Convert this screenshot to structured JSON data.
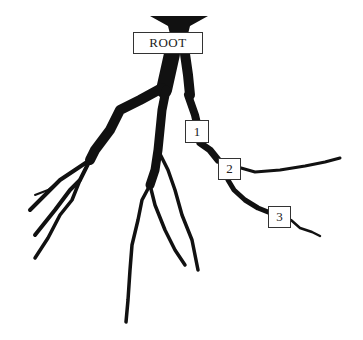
{
  "diagram": {
    "type": "root system tree",
    "labels": {
      "root": "ROOT",
      "node1": "1",
      "node2": "2",
      "node3": "3"
    },
    "colors": {
      "root_fill": "#111111",
      "background": "#ffffff",
      "box_border": "#333333"
    }
  }
}
